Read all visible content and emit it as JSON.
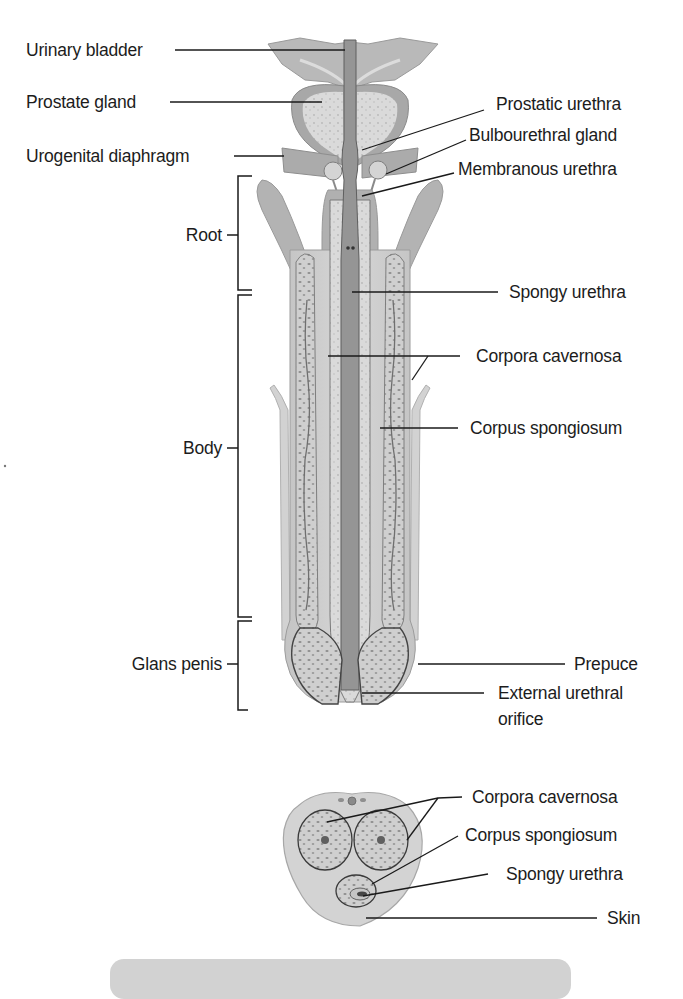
{
  "figure": {
    "type": "anatomical-diagram",
    "colors": {
      "background": "#ffffff",
      "tissue_light": "#d9d9d9",
      "tissue_mid": "#b4b4b4",
      "tissue_dark": "#8f8f8f",
      "urethra": "#9a9a9a",
      "leader_line": "#1a1a1a",
      "footer_box": "#d2d2d2"
    }
  },
  "longitudinal_section": {
    "left_labels": [
      {
        "id": "urinary-bladder",
        "text": "Urinary bladder"
      },
      {
        "id": "prostate-gland",
        "text": "Prostate gland"
      },
      {
        "id": "urogenital-diaphragm",
        "text": "Urogenital diaphragm"
      }
    ],
    "region_brackets": [
      {
        "id": "root",
        "text": "Root"
      },
      {
        "id": "body",
        "text": "Body"
      },
      {
        "id": "glans-penis",
        "text": "Glans penis"
      }
    ],
    "right_labels": [
      {
        "id": "prostatic-urethra",
        "text": "Prostatic urethra"
      },
      {
        "id": "bulbourethral-gland",
        "text": "Bulbourethral gland"
      },
      {
        "id": "membranous-urethra",
        "text": "Membranous urethra"
      },
      {
        "id": "spongy-urethra",
        "text": "Spongy urethra"
      },
      {
        "id": "corpora-cavernosa",
        "text": "Corpora cavernosa"
      },
      {
        "id": "corpus-spongiosum",
        "text": "Corpus spongiosum"
      },
      {
        "id": "prepuce",
        "text": "Prepuce"
      },
      {
        "id": "external-urethral-orifice",
        "text": "External urethral\norifice",
        "line1": "External urethral",
        "line2": "orifice"
      }
    ]
  },
  "cross_section": {
    "labels": [
      {
        "id": "cs-corpora-cavernosa",
        "text": "Corpora cavernosa"
      },
      {
        "id": "cs-corpus-spongiosum",
        "text": "Corpus spongiosum"
      },
      {
        "id": "cs-spongy-urethra",
        "text": "Spongy urethra"
      },
      {
        "id": "cs-skin",
        "text": "Skin"
      }
    ]
  }
}
